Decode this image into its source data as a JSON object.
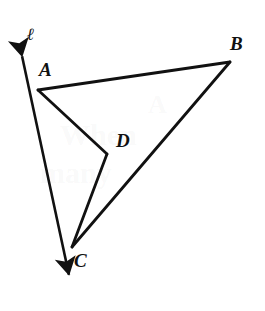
{
  "figure": {
    "type": "geometry-diagram",
    "background_color": "#ffffff",
    "stroke_color": "#111111",
    "canvas": {
      "width": 265,
      "height": 311
    },
    "line": {
      "name": "l",
      "label": "ℓ",
      "label_x": 27,
      "label_y": 26,
      "double_arrow": true,
      "start": {
        "x": 16,
        "y": 28
      },
      "end": {
        "x": 75,
        "y": 303
      },
      "stroke_width": 2.6
    },
    "points": [
      {
        "name": "A",
        "label": "A",
        "x": 38,
        "y": 90,
        "label_x": 39,
        "label_y": 60
      },
      {
        "name": "B",
        "label": "B",
        "x": 230,
        "y": 62,
        "label_x": 230,
        "label_y": 34
      },
      {
        "name": "C",
        "label": "C",
        "x": 72,
        "y": 247,
        "label_x": 74,
        "label_y": 251
      },
      {
        "name": "D",
        "label": "D",
        "x": 107,
        "y": 154,
        "label_x": 116,
        "label_y": 131
      }
    ],
    "segments": [
      {
        "name": "AB",
        "from": "A",
        "to": "B",
        "x1": 38,
        "y1": 90,
        "x2": 230,
        "y2": 62,
        "stroke_width": 2.8
      },
      {
        "name": "AD",
        "from": "A",
        "to": "D",
        "x1": 38,
        "y1": 90,
        "x2": 107,
        "y2": 154,
        "stroke_width": 2.8
      },
      {
        "name": "DC",
        "from": "D",
        "to": "C",
        "x1": 107,
        "y1": 154,
        "x2": 72,
        "y2": 247,
        "stroke_width": 2.8
      },
      {
        "name": "BC",
        "from": "B",
        "to": "C",
        "x1": 230,
        "y1": 62,
        "x2": 72,
        "y2": 247,
        "stroke_width": 2.8
      }
    ],
    "bleed_through": [
      {
        "text": "A",
        "x": 148,
        "y": 92,
        "size": 26
      },
      {
        "text": "When",
        "x": 60,
        "y": 120,
        "size": 30
      },
      {
        "text": "many",
        "x": 40,
        "y": 158,
        "size": 30
      }
    ]
  }
}
